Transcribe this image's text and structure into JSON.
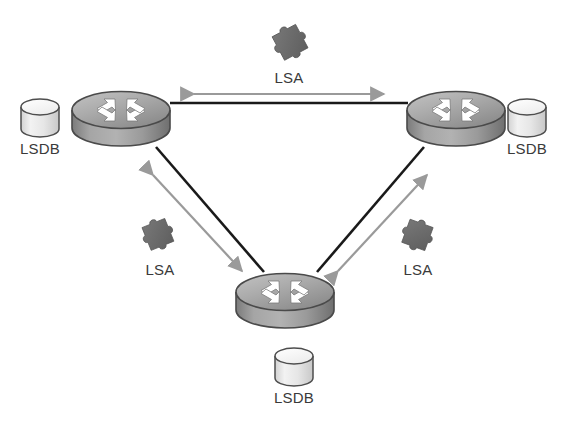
{
  "diagram": {
    "type": "network-topology",
    "background_color": "#ffffff"
  },
  "palette": {
    "router_top_light": "#b9b9b9",
    "router_top_dark": "#8d8d8d",
    "router_body_light": "#a9a9a9",
    "router_body_dark": "#707070",
    "router_outline": "#4a4a4a",
    "router_arrow_fill": "#ffffff",
    "router_arrow_outline": "#6e6e6e",
    "lsdb_top_light": "#fbfbfb",
    "lsdb_body_light": "#e2e2e2",
    "lsdb_outline": "#4d4d4d",
    "link_color": "#1a1a1a",
    "lsa_arrow_color": "#9a9a9a",
    "puzzle_fill": "#6a6a6a",
    "puzzle_outline": "#5a5a5a",
    "text_color": "#3a3a3a"
  },
  "routers": [
    {
      "id": "router-top-left",
      "name": "Router top-left",
      "cx": 121,
      "cy": 118
    },
    {
      "id": "router-top-right",
      "name": "Router top-right",
      "cx": 456,
      "cy": 118
    },
    {
      "id": "router-bottom",
      "name": "Router bottom",
      "cx": 285,
      "cy": 300
    }
  ],
  "databases": [
    {
      "id": "lsdb-left",
      "label": "LSDB",
      "cx": 40,
      "cy": 118,
      "label_x": 40,
      "label_y": 148
    },
    {
      "id": "lsdb-right",
      "label": "LSDB",
      "cx": 527,
      "cy": 118,
      "label_x": 527,
      "label_y": 148
    },
    {
      "id": "lsdb-bottom",
      "label": "LSDB",
      "cx": 294,
      "cy": 367,
      "label_x": 294,
      "label_y": 396
    }
  ],
  "links": [
    {
      "id": "link-top",
      "from": "router-top-left",
      "to": "router-top-right",
      "x1": 170,
      "y1": 103,
      "x2": 408,
      "y2": 103
    },
    {
      "id": "link-left",
      "from": "router-top-left",
      "to": "router-bottom",
      "x1": 156,
      "y1": 148,
      "x2": 262,
      "y2": 272
    },
    {
      "id": "link-right",
      "from": "router-bottom",
      "to": "router-top-right",
      "x1": 318,
      "y1": 272,
      "x2": 424,
      "y2": 148
    }
  ],
  "lsa_flows": [
    {
      "id": "lsa-top",
      "label": "LSA",
      "arrow": {
        "x1": 194,
        "y1": 94,
        "x2": 384,
        "y2": 94
      },
      "label_x": 289,
      "label_y": 78,
      "puzzle_x": 289,
      "puzzle_y": 40,
      "puzzle_rotate": -28
    },
    {
      "id": "lsa-left",
      "label": "LSA",
      "arrow": {
        "x1": 153,
        "y1": 173,
        "x2": 243,
        "y2": 272
      },
      "label_x": 160,
      "label_y": 270,
      "puzzle_x": 157,
      "puzzle_y": 232,
      "puzzle_rotate": -22
    },
    {
      "id": "lsa-right",
      "label": "LSA",
      "arrow": {
        "x1": 337,
        "y1": 272,
        "x2": 427,
        "y2": 173
      },
      "label_x": 418,
      "label_y": 270,
      "puzzle_x": 417,
      "puzzle_y": 232,
      "puzzle_rotate": 20
    }
  ]
}
